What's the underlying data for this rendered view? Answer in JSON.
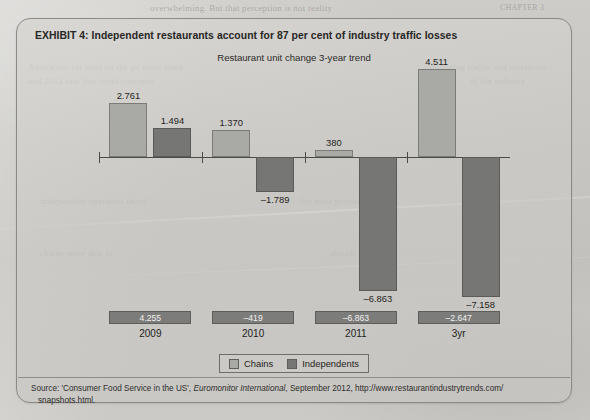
{
  "page": {
    "ghost_texts": [
      {
        "text": "overwhelming. But that perception is not reality",
        "x": 150,
        "y": 3,
        "size": 9
      },
      {
        "text": "CHAPTER 3",
        "x": 500,
        "y": 3,
        "size": 8
      },
      {
        "text": "Americans eat food on the go more often",
        "x": 28,
        "y": 62,
        "size": 9
      },
      {
        "text": "declining traffic and restaurant",
        "x": 430,
        "y": 62,
        "size": 9
      },
      {
        "text": "and 2012 saw that trend continue",
        "x": 28,
        "y": 76,
        "size": 9
      },
      {
        "text": "of the industry",
        "x": 470,
        "y": 76,
        "size": 9
      },
      {
        "text": "independent operators faced",
        "x": 40,
        "y": 196,
        "size": 9
      },
      {
        "text": "the most pressure",
        "x": 300,
        "y": 196,
        "size": 9
      },
      {
        "text": "chains were able to",
        "x": 40,
        "y": 248,
        "size": 9
      },
      {
        "text": "absorb share",
        "x": 330,
        "y": 248,
        "size": 9
      }
    ],
    "panel": {
      "title": "EXHIBIT 4:  Independent restaurants account for 87 per cent of industry traffic losses",
      "source_prefix": "Source: ",
      "source_quote": "'Consumer Food Service in the US', ",
      "source_italic": "Euromonitor International",
      "source_rest": ", September 2012, http://www.restaurantindustrytrends.com/",
      "source_line2": "snapshots.html."
    }
  },
  "chart_data": {
    "type": "bar",
    "title": "Restaurant unit change 3-year trend",
    "xlabel": "",
    "ylabel": "",
    "grid": false,
    "legend_position": "bottom-center",
    "categories": [
      "2009",
      "2010",
      "2011",
      "3yr"
    ],
    "series": [
      {
        "name": "Chains",
        "color": "#a9a9a5",
        "values": [
          2761,
          1370,
          380,
          4511
        ],
        "labels": [
          "2.761",
          "1.370",
          "380",
          "4.511"
        ]
      },
      {
        "name": "Independents",
        "color": "#767674",
        "values": [
          1494,
          -1789,
          -6863,
          -7158
        ],
        "labels": [
          "1.494",
          "-1.789",
          "-6.863",
          "-7.158"
        ]
      }
    ],
    "net_totals": {
      "values": [
        4255,
        -419,
        -6863,
        -2647
      ],
      "labels": [
        "4.255",
        "-419",
        "-6.863",
        "-2.647"
      ]
    },
    "ylim": [
      -7600,
      4800
    ],
    "baseline": 0
  }
}
